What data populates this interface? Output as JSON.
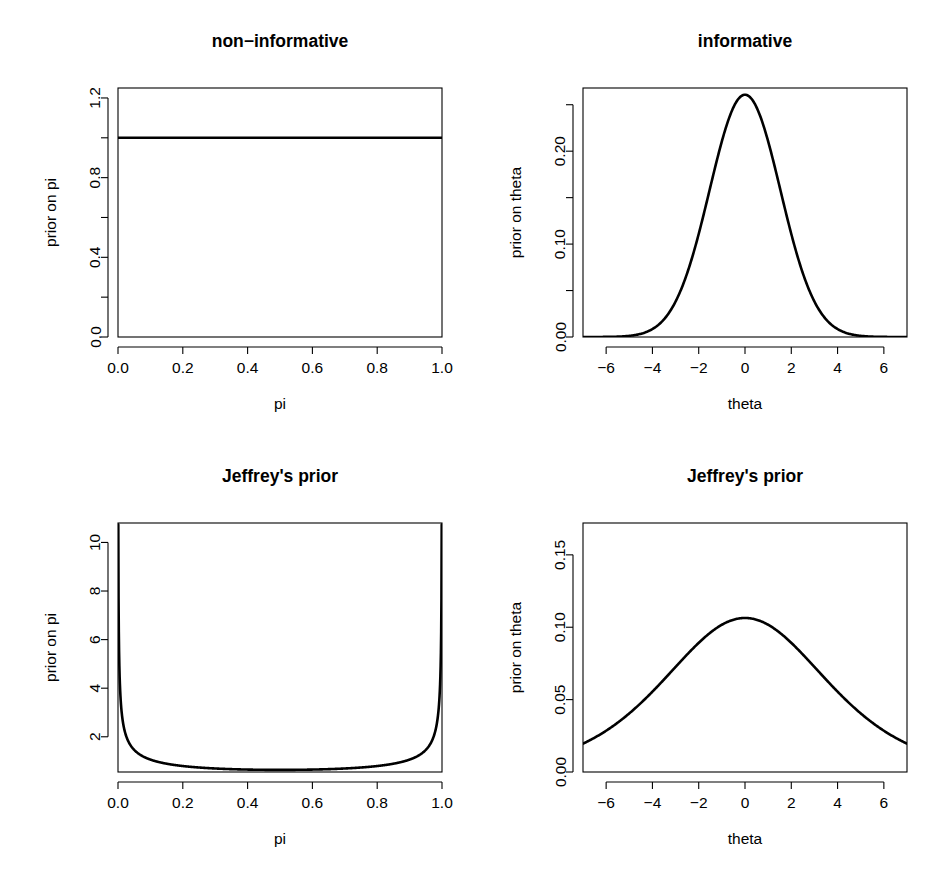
{
  "figure": {
    "layout": "2x2 grid of R base-graphics line plots",
    "background_color": "#ffffff",
    "line_color": "#000000",
    "axis_color": "#000000",
    "width": 931,
    "height": 870
  },
  "panels": [
    {
      "id": "non-informative",
      "title": "non−informative",
      "xlabel": "pi",
      "ylabel": "prior on pi"
    },
    {
      "id": "informative",
      "title": "informative",
      "xlabel": "theta",
      "ylabel": "prior on theta"
    },
    {
      "id": "jeffreys-pi",
      "title": "Jeffrey's prior",
      "xlabel": "pi",
      "ylabel": "prior on pi"
    },
    {
      "id": "jeffreys-theta",
      "title": "Jeffrey's prior",
      "xlabel": "theta",
      "ylabel": "prior on theta"
    }
  ],
  "chart_data": [
    {
      "type": "line",
      "id": "non-informative",
      "title": "non−informative",
      "xlabel": "pi",
      "ylabel": "prior on pi",
      "xlim": [
        0,
        1
      ],
      "ylim": [
        0,
        1.25
      ],
      "grid": false,
      "legend": null,
      "xticks": [
        0.0,
        0.2,
        0.4,
        0.6,
        0.8,
        1.0
      ],
      "xticklabels": [
        "0.0",
        "0.2",
        "0.4",
        "0.6",
        "0.8",
        "1.0"
      ],
      "yticks": [
        0.0,
        0.4,
        0.8,
        1.2
      ],
      "yticklabels": [
        "0.0",
        "0.4",
        "0.8",
        "1.2"
      ],
      "yminorticks": [
        0.2,
        0.6,
        1.0
      ],
      "series": [
        {
          "name": "uniform prior Beta(1,1)",
          "x": [
            0.0,
            0.1,
            0.2,
            0.3,
            0.4,
            0.5,
            0.6,
            0.7,
            0.8,
            0.9,
            1.0
          ],
          "values": [
            1,
            1,
            1,
            1,
            1,
            1,
            1,
            1,
            1,
            1,
            1
          ]
        }
      ]
    },
    {
      "type": "line",
      "id": "informative",
      "title": "informative",
      "xlabel": "theta",
      "ylabel": "prior on theta",
      "xlim": [
        -7,
        7
      ],
      "ylim": [
        0,
        0.268
      ],
      "grid": false,
      "legend": null,
      "xticks": [
        -6,
        -4,
        -2,
        0,
        2,
        4,
        6
      ],
      "xticklabels": [
        "−6",
        "−4",
        "−2",
        "0",
        "2",
        "4",
        "6"
      ],
      "yticks": [
        0.0,
        0.1,
        0.2
      ],
      "yticklabels": [
        "0.00",
        "0.10",
        "0.20"
      ],
      "yminorticks": [
        0.05,
        0.15,
        0.25
      ],
      "series": [
        {
          "name": "normal prior (sd ≈ 1.5)",
          "x": [
            -7,
            -6,
            -5,
            -4,
            -3,
            -2,
            -1,
            0,
            1,
            2,
            3,
            4,
            5,
            6,
            7
          ],
          "values": [
            0.003,
            0.005,
            0.014,
            0.036,
            0.074,
            0.127,
            0.2,
            0.26,
            0.2,
            0.127,
            0.074,
            0.036,
            0.014,
            0.005,
            0.003
          ]
        }
      ]
    },
    {
      "type": "line",
      "id": "jeffreys-pi",
      "title": "Jeffrey's prior",
      "xlabel": "pi",
      "ylabel": "prior on pi",
      "xlim": [
        0,
        1
      ],
      "ylim": [
        0.55,
        10.8
      ],
      "grid": false,
      "legend": null,
      "xticks": [
        0.0,
        0.2,
        0.4,
        0.6,
        0.8,
        1.0
      ],
      "xticklabels": [
        "0.0",
        "0.2",
        "0.4",
        "0.6",
        "0.8",
        "1.0"
      ],
      "yticks": [
        2,
        4,
        6,
        8,
        10
      ],
      "yticklabels": [
        "2",
        "4",
        "6",
        "8",
        "10"
      ],
      "yminorticks": [],
      "series": [
        {
          "name": "Beta(0.5, 0.5) density",
          "x": [
            0.001,
            0.01,
            0.05,
            0.1,
            0.2,
            0.3,
            0.4,
            0.5,
            0.6,
            0.7,
            0.8,
            0.9,
            0.95,
            0.99,
            0.999
          ],
          "values": [
            10.07,
            3.2,
            1.46,
            1.06,
            0.8,
            0.69,
            0.65,
            0.64,
            0.65,
            0.69,
            0.8,
            1.06,
            1.46,
            3.2,
            10.07
          ]
        }
      ]
    },
    {
      "type": "line",
      "id": "jeffreys-theta",
      "title": "Jeffrey's prior",
      "xlabel": "theta",
      "ylabel": "prior on theta",
      "xlim": [
        -7,
        7
      ],
      "ylim": [
        0,
        0.172
      ],
      "grid": false,
      "legend": null,
      "xticks": [
        -6,
        -4,
        -2,
        0,
        2,
        4,
        6
      ],
      "xticklabels": [
        "−6",
        "−4",
        "−2",
        "0",
        "2",
        "4",
        "6"
      ],
      "yticks": [
        0.0,
        0.05,
        0.1,
        0.15
      ],
      "yticklabels": [
        "0.00",
        "0.05",
        "0.10",
        "0.15"
      ],
      "yminorticks": [],
      "series": [
        {
          "name": "logistic-type prior on theta",
          "x": [
            -7,
            -6,
            -5,
            -4,
            -3,
            -2,
            -1,
            0,
            1,
            2,
            3,
            4,
            5,
            6,
            7
          ],
          "values": [
            0.011,
            0.018,
            0.03,
            0.049,
            0.078,
            0.112,
            0.146,
            0.165,
            0.146,
            0.112,
            0.078,
            0.049,
            0.03,
            0.018,
            0.011
          ]
        }
      ]
    }
  ]
}
